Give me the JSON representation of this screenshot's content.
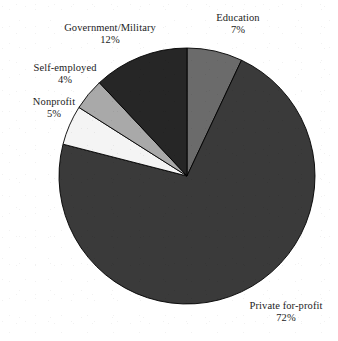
{
  "chart_data": {
    "type": "pie",
    "title": "",
    "subtitle": "",
    "xlabel": "",
    "ylabel": "",
    "legend_position": "none",
    "grid": false,
    "labels_show_percent": true,
    "start_angle_deg": 0,
    "direction": "clockwise",
    "categories": [
      "Education",
      "Private for-profit",
      "Nonprofit",
      "Self-employed",
      "Government/Military"
    ],
    "values": [
      7,
      72,
      5,
      4,
      12
    ],
    "units": "percent",
    "total": 100,
    "slices": [
      {
        "name": "Education",
        "value": 7,
        "percent_text": "7%",
        "color": "#6b6b6b",
        "start_deg": 0,
        "end_deg": 25.2
      },
      {
        "name": "Private for-profit",
        "value": 72,
        "percent_text": "72%",
        "color": "#3a3a3a",
        "start_deg": 25.2,
        "end_deg": 284.4
      },
      {
        "name": "Nonprofit",
        "value": 5,
        "percent_text": "5%",
        "color": "#f4f4f4",
        "start_deg": 284.4,
        "end_deg": 302.4
      },
      {
        "name": "Self-employed",
        "value": 4,
        "percent_text": "4%",
        "color": "#a9a9a9",
        "start_deg": 302.4,
        "end_deg": 316.8
      },
      {
        "name": "Government/Military",
        "value": 12,
        "percent_text": "12%",
        "color": "#262626",
        "start_deg": 316.8,
        "end_deg": 360
      }
    ]
  },
  "labels": {
    "education": {
      "name": "Education",
      "percent": "7%"
    },
    "government": {
      "name": "Government/Military",
      "percent": "12%"
    },
    "selfemployed": {
      "name": "Self-employed",
      "percent": "4%"
    },
    "nonprofit": {
      "name": "Nonprofit",
      "percent": "5%"
    },
    "private": {
      "name": "Private for-profit",
      "percent": "72%"
    }
  },
  "colors": {
    "background": "#ffffff",
    "text": "#1c1c1c",
    "outline": "#000000",
    "education": "#6b6b6b",
    "private_for_profit": "#3a3a3a",
    "nonprofit": "#f4f4f4",
    "self_employed": "#a9a9a9",
    "government_military": "#262626"
  },
  "geometry": {
    "cx": 187,
    "cy": 176,
    "r": 128
  }
}
